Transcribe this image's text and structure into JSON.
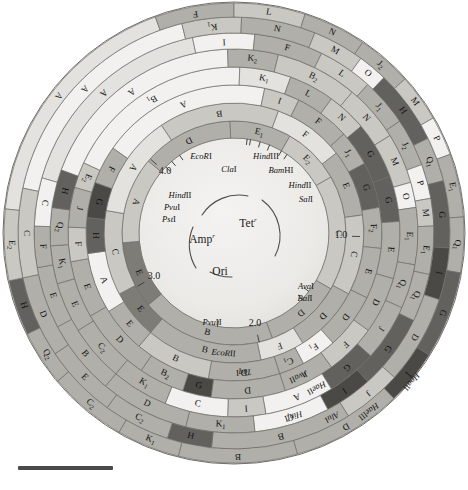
{
  "figure": {
    "center_x": 234,
    "center_y": 233,
    "scale_bar": {
      "label": "",
      "width_px": 95
    }
  },
  "genes": [
    {
      "name": "Amp",
      "superscript": "r",
      "x": 202,
      "y": 240
    },
    {
      "name": "Tet",
      "superscript": "r",
      "x": 248,
      "y": 224
    },
    {
      "name": "Ori",
      "superscript": "",
      "x": 220,
      "y": 272
    }
  ],
  "coordinate_ticks": [
    {
      "label": "1.0",
      "x": 341,
      "y": 236
    },
    {
      "label": "2.0",
      "x": 255,
      "y": 324
    },
    {
      "label": "3.0",
      "x": 154,
      "y": 277
    },
    {
      "label": "4.0",
      "x": 165,
      "y": 172
    }
  ],
  "unique_sites": [
    {
      "name": "EcoRI",
      "italic_part": "EcoR",
      "roman_part": "I",
      "x": 201,
      "y": 157,
      "angle": -82
    },
    {
      "name": "HindIII",
      "italic_part": "Hind",
      "roman_part": "III",
      "x": 266,
      "y": 157,
      "angle": -74
    },
    {
      "name": "ClaI",
      "italic_part": "Cla",
      "roman_part": "I",
      "x": 229,
      "y": 170,
      "angle": -80
    },
    {
      "name": "BamHI",
      "italic_part": "Bam",
      "roman_part": "HI",
      "x": 281,
      "y": 171,
      "angle": -68
    },
    {
      "name": "HindII",
      "italic_part": "Hind",
      "roman_part": "II",
      "x": 300,
      "y": 186,
      "angle": -60
    },
    {
      "name": "SalI",
      "italic_part": "Sal",
      "roman_part": "I",
      "x": 306,
      "y": 200,
      "angle": -56
    },
    {
      "name": "AvaI",
      "italic_part": "Ava",
      "roman_part": "I",
      "x": 306,
      "y": 287,
      "angle": 38
    },
    {
      "name": "BalI",
      "italic_part": "Bal",
      "roman_part": "I",
      "x": 305,
      "y": 299,
      "angle": 44
    },
    {
      "name": "PvuII",
      "italic_part": "Pvu",
      "roman_part": "II",
      "x": 212,
      "y": 323,
      "angle": 100
    },
    {
      "name": "HindII",
      "italic_part": "Hind",
      "roman_part": "II",
      "x": 180,
      "y": 196,
      "angle": -125
    },
    {
      "name": "PvuI",
      "italic_part": "Pvu",
      "roman_part": "I",
      "x": 172,
      "y": 208,
      "angle": -131
    },
    {
      "name": "PstI",
      "italic_part": "Pst",
      "roman_part": "I",
      "x": 169,
      "y": 220,
      "angle": -136
    }
  ],
  "enzyme_ring_names": [
    {
      "name": "EcoRII",
      "italic_part": "EcoR",
      "roman_part": "II",
      "ring": 1,
      "angle": 95
    },
    {
      "name": "TaqI",
      "italic_part": "Taq",
      "roman_part": "I",
      "ring": 2,
      "angle": 86
    },
    {
      "name": "AvaII",
      "italic_part": "Ava",
      "roman_part": "II",
      "ring": 3,
      "angle": 66
    },
    {
      "name": "HaeII",
      "italic_part": "Hae",
      "roman_part": "II",
      "ring": 4,
      "angle": 62
    },
    {
      "name": "HinfI",
      "italic_part": "Hinf",
      "roman_part": "I",
      "ring": 5,
      "angle": 72
    },
    {
      "name": "AluI",
      "italic_part": "Alu",
      "roman_part": "I",
      "ring": 6,
      "angle": 62
    },
    {
      "name": "HaeIII",
      "italic_part": "Hae",
      "roman_part": "III",
      "ring": 7,
      "angle": 53
    },
    {
      "name": "HpaII",
      "italic_part": "Hpa",
      "roman_part": "II",
      "ring": 8,
      "angle": 40
    }
  ],
  "colors": {
    "background": "#ffffff",
    "inner_fill": "#e9e9e7",
    "light": "#f2f1ef",
    "pale": "#e3e2de",
    "mid_light": "#c9c8c3",
    "mid": "#b0afa9",
    "mid_dark": "#9a9993",
    "dark": "#7d7c77",
    "darker": "#62615d",
    "very_dark": "#4a4945",
    "stroke": "#6e6d68",
    "scale_bar": "#4a4a4a",
    "text": "#1a1a1a"
  },
  "rings": [
    {
      "index": 0,
      "name": "ring-innermost",
      "r_inner": 95,
      "r_outer": 112,
      "segments": [
        {
          "label": "D",
          "start": 220,
          "end": 268,
          "tone": "mid"
        },
        {
          "label": "E1",
          "start": 268,
          "end": 300,
          "tone": "mid"
        },
        {
          "label": "E2",
          "start": 300,
          "end": 330,
          "tone": "mid_light"
        },
        {
          "label": "C",
          "start": 330,
          "end": 30,
          "tone": "mid_light"
        },
        {
          "label": "D",
          "start": 30,
          "end": 70,
          "tone": "mid"
        },
        {
          "label": "B",
          "start": 70,
          "end": 140,
          "tone": "mid"
        },
        {
          "label": "E",
          "start": 140,
          "end": 175,
          "tone": "dark"
        },
        {
          "label": "A",
          "start": 175,
          "end": 220,
          "tone": "mid_light"
        }
      ]
    },
    {
      "index": 1,
      "name": "ring-2",
      "r_inner": 112,
      "r_outer": 130,
      "segments": [
        {
          "label": "B",
          "start": 236,
          "end": 290,
          "tone": "mid_light"
        },
        {
          "label": "F",
          "start": 290,
          "end": 322,
          "tone": "pale"
        },
        {
          "label": "E",
          "start": 322,
          "end": 352,
          "tone": "mid"
        },
        {
          "label": "C",
          "start": 352,
          "end": 28,
          "tone": "mid_light"
        },
        {
          "label": "D",
          "start": 28,
          "end": 58,
          "tone": "mid"
        },
        {
          "label": "F",
          "start": 58,
          "end": 78,
          "tone": "pale"
        },
        {
          "label": "B",
          "start": 78,
          "end": 130,
          "tone": "mid"
        },
        {
          "label": "E",
          "start": 130,
          "end": 152,
          "tone": "dark"
        },
        {
          "label": "C",
          "start": 152,
          "end": 190,
          "tone": "mid_light"
        },
        {
          "label": "A",
          "start": 190,
          "end": 236,
          "tone": "pale"
        }
      ]
    },
    {
      "index": 2,
      "name": "ring-3",
      "r_inner": 130,
      "r_outer": 148,
      "segments": [
        {
          "label": "A",
          "start": 215,
          "end": 282,
          "tone": "light"
        },
        {
          "label": "I",
          "start": 282,
          "end": 296,
          "tone": "mid_light"
        },
        {
          "label": "F",
          "start": 296,
          "end": 318,
          "tone": "mid"
        },
        {
          "label": "J1",
          "start": 318,
          "end": 332,
          "tone": "mid"
        },
        {
          "label": "G",
          "start": 332,
          "end": 350,
          "tone": "darker"
        },
        {
          "label": "F2",
          "start": 350,
          "end": 6,
          "tone": "mid"
        },
        {
          "label": "E",
          "start": 6,
          "end": 26,
          "tone": "mid"
        },
        {
          "label": "D",
          "start": 26,
          "end": 48,
          "tone": "mid"
        },
        {
          "label": "F1",
          "start": 48,
          "end": 62,
          "tone": "light"
        },
        {
          "label": "C1",
          "start": 62,
          "end": 72,
          "tone": "mid"
        },
        {
          "label": "D",
          "start": 72,
          "end": 100,
          "tone": "mid"
        },
        {
          "label": "B",
          "start": 100,
          "end": 130,
          "tone": "mid_light"
        },
        {
          "label": "E",
          "start": 130,
          "end": 148,
          "tone": "mid"
        },
        {
          "label": "A",
          "start": 148,
          "end": 172,
          "tone": "light"
        },
        {
          "label": "H",
          "start": 172,
          "end": 186,
          "tone": "darker"
        },
        {
          "label": "G",
          "start": 186,
          "end": 200,
          "tone": "very_dark"
        },
        {
          "label": "F",
          "start": 200,
          "end": 215,
          "tone": "mid"
        }
      ]
    },
    {
      "index": 3,
      "name": "ring-4",
      "r_inner": 148,
      "r_outer": 166,
      "segments": [
        {
          "label": "B1",
          "start": 205,
          "end": 272,
          "tone": "light"
        },
        {
          "label": "K1",
          "start": 272,
          "end": 290,
          "tone": "pale"
        },
        {
          "label": "L",
          "start": 290,
          "end": 306,
          "tone": "mid"
        },
        {
          "label": "N",
          "start": 306,
          "end": 320,
          "tone": "mid_light"
        },
        {
          "label": "G",
          "start": 320,
          "end": 340,
          "tone": "darker"
        },
        {
          "label": "G",
          "start": 340,
          "end": 356,
          "tone": "darker"
        },
        {
          "label": "E",
          "start": 356,
          "end": 16,
          "tone": "mid"
        },
        {
          "label": "D",
          "start": 16,
          "end": 36,
          "tone": "mid"
        },
        {
          "label": "F",
          "start": 36,
          "end": 54,
          "tone": "mid_light"
        },
        {
          "label": "J",
          "start": 54,
          "end": 72,
          "tone": "mid"
        },
        {
          "label": "D",
          "start": 72,
          "end": 98,
          "tone": "mid"
        },
        {
          "label": "G",
          "start": 98,
          "end": 108,
          "tone": "very_dark"
        },
        {
          "label": "B2",
          "start": 108,
          "end": 124,
          "tone": "mid"
        },
        {
          "label": "D",
          "start": 124,
          "end": 150,
          "tone": "mid"
        },
        {
          "label": "E",
          "start": 150,
          "end": 170,
          "tone": "mid"
        },
        {
          "label": "F",
          "start": 170,
          "end": 182,
          "tone": "mid_light"
        },
        {
          "label": "J",
          "start": 182,
          "end": 196,
          "tone": "mid"
        },
        {
          "label": "E2",
          "start": 196,
          "end": 205,
          "tone": "mid_light"
        }
      ]
    },
    {
      "index": 4,
      "name": "ring-5",
      "r_inner": 166,
      "r_outer": 184,
      "segments": [
        {
          "label": "A",
          "start": 200,
          "end": 268,
          "tone": "light"
        },
        {
          "label": "K2",
          "start": 268,
          "end": 284,
          "tone": "mid"
        },
        {
          "label": "B2",
          "start": 284,
          "end": 310,
          "tone": "mid_light"
        },
        {
          "label": "N",
          "start": 310,
          "end": 328,
          "tone": "mid_light"
        },
        {
          "label": "M",
          "start": 328,
          "end": 344,
          "tone": "mid_light"
        },
        {
          "label": "O",
          "start": 344,
          "end": 352,
          "tone": "light"
        },
        {
          "label": "E1",
          "start": 352,
          "end": 10,
          "tone": "mid"
        },
        {
          "label": "Q1",
          "start": 10,
          "end": 24,
          "tone": "mid"
        },
        {
          "label": "J",
          "start": 24,
          "end": 42,
          "tone": "mid"
        },
        {
          "label": "G",
          "start": 42,
          "end": 58,
          "tone": "darker"
        },
        {
          "label": "A",
          "start": 58,
          "end": 80,
          "tone": "light"
        },
        {
          "label": "I",
          "start": 80,
          "end": 92,
          "tone": "mid_light"
        },
        {
          "label": "C",
          "start": 92,
          "end": 112,
          "tone": "light"
        },
        {
          "label": "K1",
          "start": 112,
          "end": 130,
          "tone": "mid"
        },
        {
          "label": "C2",
          "start": 130,
          "end": 148,
          "tone": "mid"
        },
        {
          "label": "E",
          "start": 148,
          "end": 164,
          "tone": "mid"
        },
        {
          "label": "K1",
          "start": 164,
          "end": 176,
          "tone": "mid"
        },
        {
          "label": "Q2",
          "start": 176,
          "end": 188,
          "tone": "mid"
        },
        {
          "label": "H",
          "start": 188,
          "end": 200,
          "tone": "darker"
        }
      ]
    },
    {
      "index": 5,
      "name": "ring-6",
      "r_inner": 184,
      "r_outer": 200,
      "segments": [
        {
          "label": "A",
          "start": 196,
          "end": 258,
          "tone": "pale"
        },
        {
          "label": "I",
          "start": 258,
          "end": 276,
          "tone": "light"
        },
        {
          "label": "F",
          "start": 276,
          "end": 296,
          "tone": "mid"
        },
        {
          "label": "L",
          "start": 296,
          "end": 312,
          "tone": "mid_light"
        },
        {
          "label": "J1",
          "start": 312,
          "end": 326,
          "tone": "mid"
        },
        {
          "label": "J2",
          "start": 326,
          "end": 340,
          "tone": "mid"
        },
        {
          "label": "P",
          "start": 340,
          "end": 350,
          "tone": "light"
        },
        {
          "label": "M",
          "start": 350,
          "end": 358,
          "tone": "mid_light"
        },
        {
          "label": "E1",
          "start": 358,
          "end": 12,
          "tone": "mid"
        },
        {
          "label": "Q1",
          "start": 12,
          "end": 26,
          "tone": "mid"
        },
        {
          "label": "G",
          "start": 26,
          "end": 48,
          "tone": "darker"
        },
        {
          "label": "I",
          "start": 48,
          "end": 62,
          "tone": "very_dark"
        },
        {
          "label": "C",
          "start": 62,
          "end": 84,
          "tone": "light"
        },
        {
          "label": "K1",
          "start": 84,
          "end": 104,
          "tone": "mid"
        },
        {
          "label": "D",
          "start": 104,
          "end": 130,
          "tone": "mid"
        },
        {
          "label": "B",
          "start": 130,
          "end": 152,
          "tone": "mid"
        },
        {
          "label": "E",
          "start": 152,
          "end": 170,
          "tone": "mid"
        },
        {
          "label": "F",
          "start": 170,
          "end": 182,
          "tone": "mid"
        },
        {
          "label": "C",
          "start": 182,
          "end": 196,
          "tone": "light"
        }
      ]
    },
    {
      "index": 6,
      "name": "ring-7",
      "r_inner": 200,
      "r_outer": 216,
      "segments": [
        {
          "label": "A",
          "start": 192,
          "end": 256,
          "tone": "light"
        },
        {
          "label": "K1",
          "start": 256,
          "end": 272,
          "tone": "mid_light"
        },
        {
          "label": "N",
          "start": 272,
          "end": 292,
          "tone": "mid"
        },
        {
          "label": "M",
          "start": 292,
          "end": 306,
          "tone": "mid_light"
        },
        {
          "label": "O",
          "start": 306,
          "end": 314,
          "tone": "light"
        },
        {
          "label": "H",
          "start": 314,
          "end": 334,
          "tone": "darker"
        },
        {
          "label": "Q1",
          "start": 334,
          "end": 346,
          "tone": "mid"
        },
        {
          "label": "G",
          "start": 346,
          "end": 4,
          "tone": "darker"
        },
        {
          "label": "I",
          "start": 4,
          "end": 18,
          "tone": "very_dark"
        },
        {
          "label": "D",
          "start": 18,
          "end": 42,
          "tone": "mid"
        },
        {
          "label": "J",
          "start": 42,
          "end": 58,
          "tone": "mid_light"
        },
        {
          "label": "B",
          "start": 58,
          "end": 96,
          "tone": "mid"
        },
        {
          "label": "H",
          "start": 96,
          "end": 108,
          "tone": "darker"
        },
        {
          "label": "C2",
          "start": 108,
          "end": 126,
          "tone": "mid"
        },
        {
          "label": "E",
          "start": 126,
          "end": 146,
          "tone": "mid"
        },
        {
          "label": "D",
          "start": 146,
          "end": 168,
          "tone": "mid"
        },
        {
          "label": "C",
          "start": 168,
          "end": 192,
          "tone": "mid_light"
        }
      ]
    },
    {
      "index": 7,
      "name": "ring-8",
      "r_inner": 216,
      "r_outer": 230,
      "segments": [
        {
          "label": "A",
          "start": 186,
          "end": 250,
          "tone": "pale"
        },
        {
          "label": "F",
          "start": 250,
          "end": 270,
          "tone": "mid"
        },
        {
          "label": "L",
          "start": 270,
          "end": 288,
          "tone": "mid_light"
        },
        {
          "label": "N",
          "start": 288,
          "end": 304,
          "tone": "mid"
        },
        {
          "label": "J2",
          "start": 304,
          "end": 318,
          "tone": "mid"
        },
        {
          "label": "M",
          "start": 318,
          "end": 330,
          "tone": "mid_light"
        },
        {
          "label": "P",
          "start": 330,
          "end": 340,
          "tone": "light"
        },
        {
          "label": "E1",
          "start": 340,
          "end": 356,
          "tone": "mid"
        },
        {
          "label": "Q1",
          "start": 356,
          "end": 10,
          "tone": "mid"
        },
        {
          "label": "G",
          "start": 10,
          "end": 32,
          "tone": "darker"
        },
        {
          "label": "I",
          "start": 32,
          "end": 46,
          "tone": "very_dark"
        },
        {
          "label": "D",
          "start": 46,
          "end": 74,
          "tone": "mid"
        },
        {
          "label": "B",
          "start": 74,
          "end": 104,
          "tone": "mid"
        },
        {
          "label": "K1",
          "start": 104,
          "end": 120,
          "tone": "mid"
        },
        {
          "label": "C2",
          "start": 120,
          "end": 140,
          "tone": "mid"
        },
        {
          "label": "Q2",
          "start": 140,
          "end": 154,
          "tone": "mid"
        },
        {
          "label": "H",
          "start": 154,
          "end": 168,
          "tone": "darker"
        },
        {
          "label": "E2",
          "start": 168,
          "end": 186,
          "tone": "mid_light"
        }
      ]
    },
    {
      "index": 8,
      "name": "ring-outermost",
      "r_inner": 230,
      "r_outer": 232,
      "segments": []
    }
  ]
}
